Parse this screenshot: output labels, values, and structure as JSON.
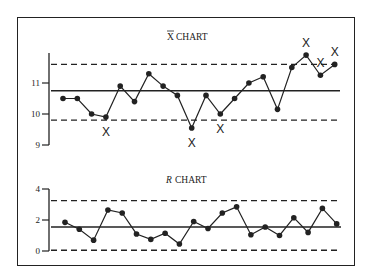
{
  "chart_data": [
    {
      "type": "line",
      "title": "X̄ CHART",
      "title_parts": {
        "symbol": "X",
        "text": "CHART"
      },
      "xlabel": "",
      "ylabel": "",
      "ylim": [
        9,
        12.2
      ],
      "yticks": [
        9,
        10,
        11
      ],
      "ytick_labels": [
        "9",
        "10",
        "11"
      ],
      "grid": false,
      "control_limits": {
        "ucl": 11.6,
        "center": 10.75,
        "lcl": 9.8
      },
      "x": [
        1,
        2,
        3,
        4,
        5,
        6,
        7,
        8,
        9,
        10,
        11,
        12,
        13,
        14,
        15,
        16,
        17,
        18,
        19,
        20
      ],
      "values": [
        10.5,
        10.5,
        10.0,
        9.9,
        10.9,
        10.4,
        11.3,
        10.9,
        10.6,
        9.55,
        10.6,
        10.0,
        10.5,
        11.0,
        11.2,
        10.15,
        11.5,
        11.9,
        11.25,
        11.6
      ],
      "out_of_control_marks": [
        4,
        10,
        12,
        18,
        19,
        20
      ],
      "marker": "filled-circle",
      "flag_marker": "X"
    },
    {
      "type": "line",
      "title": "R CHART",
      "title_parts": {
        "symbol": "R",
        "text": "CHART"
      },
      "xlabel": "",
      "ylabel": "",
      "ylim": [
        0,
        4
      ],
      "yticks": [
        0,
        2,
        4
      ],
      "ytick_labels": [
        "0",
        "2",
        "4"
      ],
      "grid": false,
      "control_limits": {
        "ucl": 3.25,
        "center": 1.55,
        "lcl": 0.05
      },
      "x": [
        1,
        2,
        3,
        4,
        5,
        6,
        7,
        8,
        9,
        10,
        11,
        12,
        13,
        14,
        15,
        16,
        17,
        18,
        19,
        20
      ],
      "values": [
        1.85,
        1.4,
        0.7,
        2.65,
        2.45,
        1.1,
        0.75,
        1.15,
        0.45,
        1.9,
        1.45,
        2.45,
        2.85,
        1.05,
        1.55,
        1.0,
        2.15,
        1.2,
        2.75,
        1.75
      ],
      "marker": "filled-circle"
    }
  ],
  "labels": {
    "xbar_symbol": "X",
    "xbar_title": "CHART",
    "r_symbol": "R",
    "r_title": "CHART",
    "flag": "X"
  },
  "colors": {
    "ink": "#222222",
    "background": "#ffffff"
  }
}
